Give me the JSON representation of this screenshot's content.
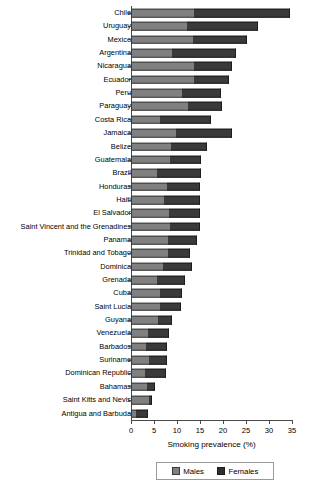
{
  "chart_data": {
    "type": "bar",
    "orientation": "horizontal",
    "stacked": true,
    "title": "",
    "xlabel": "Smoking prevalence (%)",
    "ylabel": "",
    "xlim": [
      0,
      35
    ],
    "xticks": [
      0,
      5,
      10,
      15,
      20,
      25,
      30,
      35
    ],
    "grid": false,
    "legend_position": "bottom",
    "categories": [
      "Chile",
      "Uruguay",
      "Mexico",
      "Argentina",
      "Nicaragua",
      "Ecuador",
      "Peru",
      "Paraguay",
      "Costa Rica",
      "Jamaica",
      "Belize",
      "Guatemala",
      "Brazil",
      "Honduras",
      "Haiti",
      "El Salvador",
      "Saint Vincent and the Grenadines",
      "Panama",
      "Trinidad and Tobago",
      "Dominica",
      "Grenada",
      "Cuba",
      "Saint Lucia",
      "Guyana",
      "Venezuela",
      "Barbados",
      "Suriname",
      "Dominican Republic",
      "Bahamas",
      "Saint Kitts and Nevis",
      "Antigua and Barbuda"
    ],
    "series": [
      {
        "name": "Males",
        "color": "#808080",
        "values": [
          13.7,
          12.2,
          13.5,
          8.9,
          13.7,
          13.7,
          11.1,
          12.4,
          6.3,
          9.8,
          8.7,
          8.5,
          5.7,
          7.8,
          7.2,
          8.3,
          8.5,
          8.0,
          8.0,
          7.0,
          5.7,
          6.3,
          6.3,
          5.9,
          3.7,
          3.3,
          3.9,
          3.0,
          3.5,
          3.9,
          1.1
        ]
      },
      {
        "name": "Females",
        "color": "#3a3a3a",
        "values": [
          20.8,
          15.4,
          11.7,
          13.9,
          8.3,
          7.6,
          8.5,
          7.4,
          11.1,
          12.2,
          7.9,
          6.7,
          9.6,
          7.2,
          7.8,
          6.7,
          6.5,
          6.3,
          4.8,
          6.3,
          6.1,
          4.8,
          4.6,
          3.0,
          4.6,
          4.5,
          3.9,
          4.6,
          1.7,
          0.7,
          2.6
        ]
      }
    ],
    "totals": [
      34.5,
      27.6,
      25.2,
      22.8,
      22.0,
      21.3,
      19.6,
      19.8,
      17.4,
      22.0,
      16.6,
      15.2,
      15.3,
      15.0,
      15.0,
      15.0,
      15.0,
      14.3,
      12.8,
      13.3,
      11.8,
      11.1,
      10.9,
      8.9,
      8.3,
      7.8,
      7.8,
      7.6,
      5.2,
      4.6,
      3.7
    ]
  },
  "legend": {
    "items": [
      {
        "label": "Males",
        "swatch": "males-swatch"
      },
      {
        "label": "Females",
        "swatch": "females-swatch"
      }
    ]
  }
}
